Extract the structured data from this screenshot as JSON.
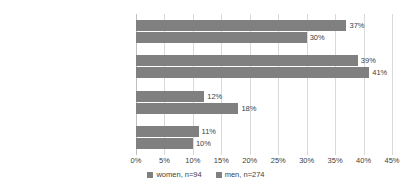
{
  "chart_data": {
    "type": "bar",
    "orientation": "horizontal",
    "title": "",
    "xlabel": "",
    "ylabel": "",
    "xlim": [
      0,
      45
    ],
    "xticks": [
      "0%",
      "5%",
      "10%",
      "15%",
      "20%",
      "25%",
      "30%",
      "35%",
      "40%",
      "45%"
    ],
    "xtick_values": [
      0,
      5,
      10,
      15,
      20,
      25,
      30,
      35,
      40,
      45
    ],
    "grid": true,
    "legend_position": "bottom",
    "categories": [
      "necessary",
      "very important",
      "fairly important",
      "hardly important/not important"
    ],
    "series": [
      {
        "name": "women, n=94",
        "color": "#808080",
        "values": [
          37,
          39,
          12,
          11
        ],
        "labels": [
          "37%",
          "39%",
          "12%",
          "11%"
        ]
      },
      {
        "name": "men, n=274",
        "color": "#808080",
        "values": [
          30,
          41,
          18,
          10
        ],
        "labels": [
          "30%",
          "41%",
          "18%",
          "10%"
        ]
      }
    ]
  },
  "legend": {
    "items": [
      {
        "label": "women, n=94",
        "color": "#808080"
      },
      {
        "label": "men, n=274",
        "color": "#808080"
      }
    ]
  },
  "colors": {
    "gridline": "#d9d9d9",
    "axis": "#bfbfbf",
    "text": "#404040",
    "background": "#ffffff"
  }
}
